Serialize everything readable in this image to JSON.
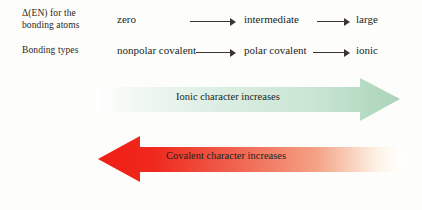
{
  "figure": {
    "rows": [
      {
        "label": "Δ(EN) for the\nbonding atoms",
        "label_line1": "Δ(EN) for the",
        "label_line2": "bonding atoms",
        "values": [
          "zero",
          "intermediate",
          "large"
        ],
        "connectors": [
          "⟶",
          "⟶"
        ]
      },
      {
        "label": "Bonding types",
        "label_line1": "Bonding types",
        "label_line2": "",
        "values": [
          "nonpolar covalent",
          "polar covalent",
          "ionic"
        ],
        "connectors": [
          "⟶",
          "⟶"
        ]
      }
    ],
    "bands": [
      {
        "id": "ionic-character",
        "caption": "Ionic character increases",
        "direction": "right",
        "color_strong": "#a9d3b8",
        "color_fade": "#fbfdfb"
      },
      {
        "id": "covalent-character",
        "caption": "Covalent character increases",
        "direction": "left",
        "color_strong": "#f01e14",
        "color_fade": "#fffdf8"
      }
    ]
  }
}
